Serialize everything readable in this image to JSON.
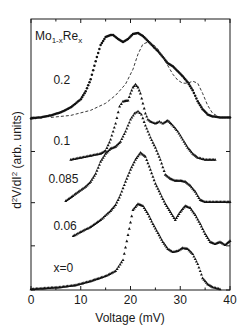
{
  "chart_data": {
    "type": "scatter",
    "title": "Mo1-xRex",
    "title_parts": {
      "base1": "Mo",
      "sub1": "1-x",
      "base2": "Re",
      "sub2": "x"
    },
    "xlabel": "Voltage (mV)",
    "ylabel": "d²V/dI² (arb. units)",
    "ylabel_parts": {
      "p1": "d",
      "sup1": "2",
      "p2": "V/dI",
      "sup2": "2",
      "p3": " (arb. units)"
    },
    "xlim": [
      0,
      40
    ],
    "xticks": [
      0,
      10,
      20,
      30,
      40
    ],
    "xtick_labels": [
      "0",
      "10",
      "20",
      "30",
      "40"
    ],
    "ylim": [
      0,
      27
    ],
    "yticks_offsets": [
      0,
      4.4,
      8.7,
      13.8,
      17.2
    ],
    "grid": false,
    "legend": "none (inline curve labels)",
    "note": "Curves are vertically offset; y values are in arbitrary units including offset. Dashed curve is a comparison curve overlaid on x=0.2 data.",
    "series": [
      {
        "name": "0.2",
        "label_pos": [
          4.5,
          20.5
        ],
        "marker": "circle",
        "style": "dots",
        "offset": 17.2,
        "points": [
          [
            0,
            17.1
          ],
          [
            2,
            17.2
          ],
          [
            4,
            17.4
          ],
          [
            6,
            17.7
          ],
          [
            8,
            18.2
          ],
          [
            10,
            19.0
          ],
          [
            11,
            19.8
          ],
          [
            12,
            21.0
          ],
          [
            13,
            22.8
          ],
          [
            14,
            24.4
          ],
          [
            15,
            25.2
          ],
          [
            16,
            25.4
          ],
          [
            16.5,
            25.4
          ],
          [
            17.5,
            25.0
          ],
          [
            18.5,
            24.7
          ],
          [
            19.5,
            25.0
          ],
          [
            20.5,
            25.5
          ],
          [
            21.5,
            25.6
          ],
          [
            22.5,
            25.3
          ],
          [
            23.5,
            24.8
          ],
          [
            24.5,
            24.3
          ],
          [
            25.5,
            23.8
          ],
          [
            26.5,
            23.2
          ],
          [
            27.5,
            22.6
          ],
          [
            28.5,
            22.3
          ],
          [
            29.5,
            21.8
          ],
          [
            30.5,
            21.3
          ],
          [
            31.5,
            20.7
          ],
          [
            32.5,
            19.9
          ],
          [
            33.5,
            18.8
          ],
          [
            34.5,
            18.0
          ],
          [
            35.5,
            17.5
          ],
          [
            36.5,
            17.3
          ],
          [
            38,
            17.2
          ],
          [
            40,
            17.2
          ]
        ]
      },
      {
        "name": "0.2 (dashed reference)",
        "marker": "none",
        "style": "dashed",
        "offset": 17.2,
        "points": [
          [
            4,
            17.2
          ],
          [
            8,
            17.4
          ],
          [
            12,
            17.9
          ],
          [
            15,
            18.6
          ],
          [
            17,
            19.4
          ],
          [
            19,
            20.5
          ],
          [
            20.5,
            22.0
          ],
          [
            21.5,
            23.5
          ],
          [
            22.5,
            24.5
          ],
          [
            23.5,
            24.7
          ],
          [
            24.5,
            24.5
          ],
          [
            25.5,
            24.0
          ],
          [
            27,
            22.8
          ],
          [
            28.5,
            21.5
          ],
          [
            29.5,
            20.9
          ],
          [
            30.5,
            20.6
          ],
          [
            31.5,
            20.6
          ],
          [
            32.5,
            20.8
          ],
          [
            33.5,
            20.6
          ],
          [
            34.5,
            19.6
          ],
          [
            35.5,
            18.4
          ],
          [
            36.5,
            17.6
          ],
          [
            38,
            17.2
          ]
        ]
      },
      {
        "name": "0.1",
        "label_pos": [
          4.5,
          14.4
        ],
        "marker": "triangle",
        "style": "dots",
        "offset": 13.0,
        "points": [
          [
            8,
            13.0
          ],
          [
            10,
            13.2
          ],
          [
            12,
            13.4
          ],
          [
            14,
            13.6
          ],
          [
            15,
            13.9
          ],
          [
            16,
            15.0
          ],
          [
            17,
            16.6
          ],
          [
            17.8,
            18.3
          ],
          [
            18.5,
            18.8
          ],
          [
            19.5,
            18.9
          ],
          [
            20,
            19.6
          ],
          [
            20.5,
            20.2
          ],
          [
            21,
            20.5
          ],
          [
            21.5,
            20.2
          ],
          [
            22,
            19.6
          ],
          [
            22.5,
            18.6
          ],
          [
            23,
            17.6
          ],
          [
            23.5,
            17.0
          ],
          [
            24,
            16.8
          ],
          [
            25,
            16.6
          ],
          [
            25.8,
            16.8
          ],
          [
            26.5,
            16.6
          ],
          [
            27.5,
            16.9
          ],
          [
            28.5,
            16.4
          ],
          [
            29.5,
            15.8
          ],
          [
            30.5,
            15.0
          ],
          [
            31.5,
            14.2
          ],
          [
            32.5,
            13.6
          ],
          [
            33.5,
            13.2
          ],
          [
            35,
            13.0
          ],
          [
            37,
            13.0
          ]
        ]
      },
      {
        "name": "0.085",
        "label_pos": [
          3.5,
          10.7
        ],
        "marker": "triangle",
        "style": "dots",
        "offset": 8.7,
        "points": [
          [
            7,
            8.9
          ],
          [
            9,
            9.6
          ],
          [
            11,
            10.3
          ],
          [
            12,
            10.8
          ],
          [
            13,
            11.6
          ],
          [
            14,
            12.8
          ],
          [
            15,
            13.6
          ],
          [
            16,
            14.1
          ],
          [
            17,
            14.3
          ],
          [
            18,
            14.8
          ],
          [
            19,
            15.8
          ],
          [
            20,
            17.0
          ],
          [
            20.8,
            17.6
          ],
          [
            21.5,
            17.8
          ],
          [
            22.2,
            17.5
          ],
          [
            23,
            16.4
          ],
          [
            24,
            15.2
          ],
          [
            25,
            14.2
          ],
          [
            26,
            13.0
          ],
          [
            27,
            11.5
          ],
          [
            28,
            11.1
          ],
          [
            29,
            10.9
          ],
          [
            30,
            10.9
          ],
          [
            31,
            10.8
          ],
          [
            32,
            10.4
          ],
          [
            33,
            9.8
          ],
          [
            34,
            9.0
          ],
          [
            35,
            8.8
          ],
          [
            37,
            8.8
          ],
          [
            40,
            8.8
          ]
        ]
      },
      {
        "name": "0.06",
        "label_pos": [
          4.5,
          6.0
        ],
        "marker": "triangle",
        "style": "dots",
        "offset": 4.4,
        "points": [
          [
            8.5,
            5.4
          ],
          [
            10,
            5.8
          ],
          [
            12,
            6.3
          ],
          [
            14,
            7.0
          ],
          [
            16,
            7.9
          ],
          [
            17,
            8.5
          ],
          [
            18,
            9.5
          ],
          [
            19,
            10.8
          ],
          [
            20,
            12.0
          ],
          [
            21,
            13.0
          ],
          [
            22,
            13.7
          ],
          [
            23,
            13.3
          ],
          [
            24,
            12.0
          ],
          [
            25,
            10.6
          ],
          [
            26,
            9.6
          ],
          [
            27,
            8.6
          ],
          [
            28,
            7.8
          ],
          [
            29,
            7.0
          ],
          [
            30,
            7.8
          ],
          [
            31,
            8.4
          ],
          [
            32,
            8.2
          ],
          [
            33,
            7.5
          ],
          [
            34,
            6.6
          ],
          [
            35,
            5.6
          ],
          [
            36,
            4.8
          ],
          [
            37,
            4.6
          ],
          [
            38,
            4.8
          ],
          [
            39,
            4.5
          ],
          [
            40,
            4.9
          ]
        ]
      },
      {
        "name": "x=0",
        "label_pos": [
          4.5,
          1.8
        ],
        "marker": "triangle",
        "style": "dots",
        "offset": 0,
        "points": [
          [
            0,
            0.1
          ],
          [
            3,
            0.2
          ],
          [
            6,
            0.3
          ],
          [
            9,
            0.5
          ],
          [
            12,
            0.9
          ],
          [
            15,
            1.4
          ],
          [
            17,
            1.9
          ],
          [
            18.5,
            3.0
          ],
          [
            19.5,
            5.5
          ],
          [
            20.5,
            8.0
          ],
          [
            21.5,
            8.6
          ],
          [
            22.5,
            8.4
          ],
          [
            23.5,
            7.6
          ],
          [
            24.5,
            6.6
          ],
          [
            25.5,
            5.7
          ],
          [
            26.5,
            4.8
          ],
          [
            27.5,
            4.1
          ],
          [
            28.5,
            3.8
          ],
          [
            29.5,
            3.9
          ],
          [
            30.5,
            4.2
          ],
          [
            31.5,
            4.1
          ],
          [
            32.5,
            3.6
          ],
          [
            33.5,
            2.6
          ],
          [
            34.5,
            1.2
          ],
          [
            35.5,
            0.6
          ],
          [
            36.5,
            0.3
          ],
          [
            38,
            0.1
          ]
        ]
      }
    ]
  }
}
